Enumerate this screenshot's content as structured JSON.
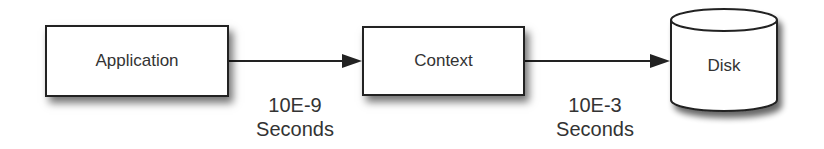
{
  "diagram": {
    "nodes": [
      {
        "id": "application",
        "label": "Application",
        "shape": "rectangle"
      },
      {
        "id": "context",
        "label": "Context",
        "shape": "rectangle"
      },
      {
        "id": "disk",
        "label": "Disk",
        "shape": "cylinder"
      }
    ],
    "edges": [
      {
        "from": "application",
        "to": "context",
        "label_line1": "10E-9",
        "label_line2": "Seconds"
      },
      {
        "from": "context",
        "to": "disk",
        "label_line1": "10E-3",
        "label_line2": "Seconds"
      }
    ],
    "colors": {
      "stroke": "#222222",
      "text": "#333333",
      "fill": "#ffffff"
    }
  }
}
